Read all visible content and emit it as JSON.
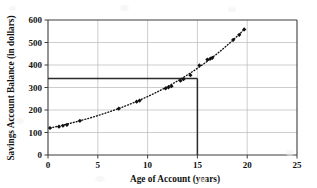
{
  "chart_data": {
    "type": "scatter",
    "title": "",
    "xlabel": "Age of Account (years)",
    "ylabel": "Savings Account Balance (in dollars)",
    "xlim": [
      0,
      25
    ],
    "ylim": [
      0,
      600
    ],
    "xticks": [
      0,
      5,
      10,
      15,
      20,
      25
    ],
    "yticks": [
      0,
      100,
      200,
      300,
      400,
      500,
      600
    ],
    "grid": true,
    "legend": "none",
    "marker": "filled-diamond",
    "trend": {
      "style": "dotted",
      "description": "dotted exponential curve through the data points"
    },
    "annotations": [
      {
        "name": "horizontal-reference-line",
        "orientation": "horizontal",
        "y": 340,
        "x_start": 0,
        "x_end": 15
      },
      {
        "name": "vertical-reference-line",
        "orientation": "vertical",
        "x": 15,
        "y_start": 0,
        "y_end": 340
      }
    ],
    "points": [
      {
        "x": 0.2,
        "y": 120
      },
      {
        "x": 1.1,
        "y": 126
      },
      {
        "x": 1.5,
        "y": 130
      },
      {
        "x": 1.9,
        "y": 134
      },
      {
        "x": 3.2,
        "y": 152
      },
      {
        "x": 7.1,
        "y": 206
      },
      {
        "x": 8.9,
        "y": 237
      },
      {
        "x": 9.2,
        "y": 242
      },
      {
        "x": 11.8,
        "y": 296
      },
      {
        "x": 12.1,
        "y": 301
      },
      {
        "x": 12.4,
        "y": 306
      },
      {
        "x": 13.3,
        "y": 330
      },
      {
        "x": 13.6,
        "y": 337
      },
      {
        "x": 14.3,
        "y": 355
      },
      {
        "x": 15.2,
        "y": 398
      },
      {
        "x": 16.0,
        "y": 424
      },
      {
        "x": 16.3,
        "y": 428
      },
      {
        "x": 16.5,
        "y": 432
      },
      {
        "x": 18.6,
        "y": 512
      },
      {
        "x": 19.2,
        "y": 534
      },
      {
        "x": 19.7,
        "y": 558
      }
    ]
  },
  "colors": {
    "data_point": "#111111",
    "axis": "#3d3d3d",
    "grid": "#b9b9b9",
    "reference_line": "#2b2b2b",
    "background": "#ffffff"
  }
}
